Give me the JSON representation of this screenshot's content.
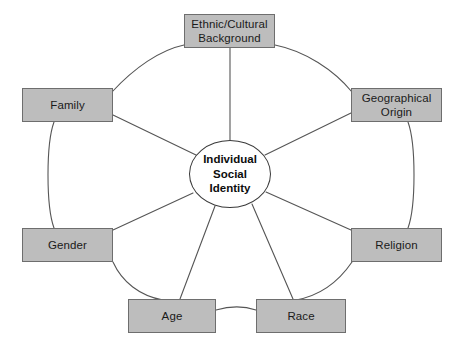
{
  "diagram": {
    "title_center": "Individual\nSocial\nIdentity",
    "colors": {
      "box_fill": "#bdbdbd",
      "box_border": "#6e6e6e",
      "line": "#555555",
      "center_fill": "#ffffff",
      "center_border": "#3a3a3a",
      "background": "#ffffff",
      "text": "#1a1a1a"
    },
    "center": {
      "label": "Individual\nSocial\nIdentity",
      "cx": 230,
      "cy": 174,
      "rx": 41,
      "ry": 34
    },
    "nodes": [
      {
        "id": "ethnic-cultural-background",
        "label": "Ethnic/Cultural\nBackground",
        "x": 184,
        "y": 14,
        "w": 91,
        "h": 34
      },
      {
        "id": "geographical-origin",
        "label": "Geographical\nOrigin",
        "x": 351,
        "y": 88,
        "w": 91,
        "h": 34
      },
      {
        "id": "family",
        "label": "Family",
        "x": 22,
        "y": 88,
        "w": 91,
        "h": 34
      },
      {
        "id": "gender",
        "label": "Gender",
        "x": 22,
        "y": 228,
        "w": 91,
        "h": 34
      },
      {
        "id": "religion",
        "label": "Religion",
        "x": 351,
        "y": 228,
        "w": 91,
        "h": 34
      },
      {
        "id": "age",
        "label": "Age",
        "x": 128,
        "y": 299,
        "w": 88,
        "h": 34
      },
      {
        "id": "race",
        "label": "Race",
        "x": 256,
        "y": 299,
        "w": 90,
        "h": 34
      }
    ],
    "spokes": [
      {
        "id": "spoke-ethnic-cultural-background",
        "from": "center",
        "to": "ethnic-cultural-background"
      },
      {
        "id": "spoke-geographical-origin",
        "from": "center",
        "to": "geographical-origin"
      },
      {
        "id": "spoke-family",
        "from": "center",
        "to": "family"
      },
      {
        "id": "spoke-gender",
        "from": "center",
        "to": "gender"
      },
      {
        "id": "spoke-religion",
        "from": "center",
        "to": "religion"
      },
      {
        "id": "spoke-age",
        "from": "center",
        "to": "age"
      },
      {
        "id": "spoke-race",
        "from": "center",
        "to": "race"
      }
    ],
    "ring_arcs": [
      {
        "id": "arc-family-to-ethnic"
      },
      {
        "id": "arc-ethnic-to-geographical"
      },
      {
        "id": "arc-geographical-to-religion"
      },
      {
        "id": "arc-religion-to-race"
      },
      {
        "id": "arc-race-to-age"
      },
      {
        "id": "arc-age-to-gender"
      },
      {
        "id": "arc-gender-to-family"
      }
    ]
  }
}
